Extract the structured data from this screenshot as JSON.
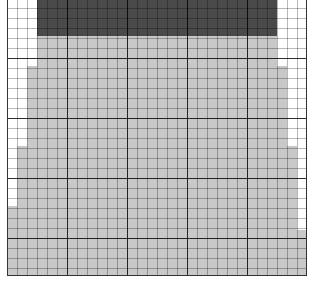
{
  "diagram": {
    "type": "grid-fill-pattern",
    "grid": {
      "origin_x": 7,
      "origin_y": 0,
      "width": 300,
      "height": 276,
      "minor_cell_px": 10,
      "major_cell_px": 60
    },
    "colors": {
      "background": "#ffffff",
      "dark_band": "#4a4a4a",
      "light_fill": "#c8c8c8",
      "grid_line": "#333333"
    },
    "dark_band": {
      "x": 30,
      "y": 0,
      "w": 240,
      "h": 36
    },
    "light_fill_rows": [
      {
        "y": 36,
        "h": 30,
        "x": 30,
        "w": 240
      },
      {
        "y": 66,
        "h": 80,
        "x": 20,
        "w": 260
      },
      {
        "y": 146,
        "h": 60,
        "x": 10,
        "w": 280
      },
      {
        "y": 206,
        "h": 24,
        "x": 0,
        "w": 290
      },
      {
        "y": 230,
        "h": 46,
        "x": 0,
        "w": 300
      }
    ]
  }
}
